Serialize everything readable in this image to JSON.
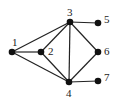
{
  "diagram": {
    "type": "undirected-graph",
    "nodes": [
      {
        "id": "1",
        "label": "1",
        "x": 12,
        "y": 52,
        "lx": 12,
        "ly": 46
      },
      {
        "id": "2",
        "label": "2",
        "x": 41,
        "y": 52,
        "lx": 48,
        "ly": 55
      },
      {
        "id": "3",
        "label": "3",
        "x": 70,
        "y": 22,
        "lx": 67,
        "ly": 16
      },
      {
        "id": "4",
        "label": "4",
        "x": 69,
        "y": 82,
        "lx": 66,
        "ly": 97
      },
      {
        "id": "5",
        "label": "5",
        "x": 98,
        "y": 23,
        "lx": 104,
        "ly": 23
      },
      {
        "id": "6",
        "label": "6",
        "x": 98,
        "y": 52,
        "lx": 104,
        "ly": 55
      },
      {
        "id": "7",
        "label": "7",
        "x": 98,
        "y": 81,
        "lx": 104,
        "ly": 81
      }
    ],
    "edges": [
      {
        "from": "1",
        "to": "2"
      },
      {
        "from": "1",
        "to": "3"
      },
      {
        "from": "1",
        "to": "4"
      },
      {
        "from": "2",
        "to": "3"
      },
      {
        "from": "2",
        "to": "4"
      },
      {
        "from": "3",
        "to": "4"
      },
      {
        "from": "3",
        "to": "5"
      },
      {
        "from": "3",
        "to": "6"
      },
      {
        "from": "4",
        "to": "6"
      },
      {
        "from": "4",
        "to": "7"
      }
    ],
    "colors": {
      "node": "#111111",
      "edge": "#222222",
      "label": "#1a1a1a"
    }
  }
}
